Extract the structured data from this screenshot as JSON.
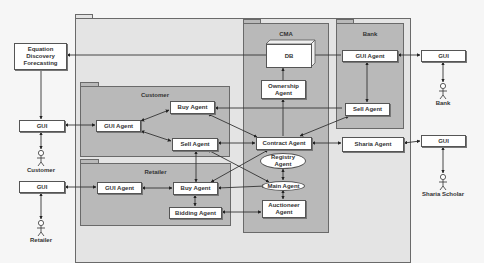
{
  "packages": {
    "cma": "CMA",
    "bank": "Bank",
    "customer": "Customer",
    "retailer": "Retailer"
  },
  "external": {
    "equation_discovery": "Equation Discovery Forecasting",
    "gui_customer": "GUI",
    "gui_retailer": "GUI",
    "gui_bank": "GUI",
    "gui_sharia": "GUI"
  },
  "actors": {
    "customer": "Customer",
    "retailer": "Retailer",
    "bank": "Bank",
    "sharia_scholar": "Sharia Scholar"
  },
  "cma": {
    "db": "DB",
    "ownership_agent": "Ownership Agent",
    "contract_agent": "Contract Agent",
    "registry_agent": "Registry Agent",
    "main_agent": "Main Agent",
    "auctioneer_agent": "Auctioneer Agent"
  },
  "bank": {
    "gui_agent": "GUI Agent",
    "sell_agent": "Sell Agent"
  },
  "customer": {
    "gui_agent": "GUI Agent",
    "buy_agent": "Buy Agent",
    "sell_agent": "Sell Agent"
  },
  "retailer": {
    "gui_agent": "GUI Agent",
    "buy_agent": "Buy Agent",
    "bidding_agent": "Bidding Agent"
  },
  "sharia_agent": "Sharia Agent"
}
